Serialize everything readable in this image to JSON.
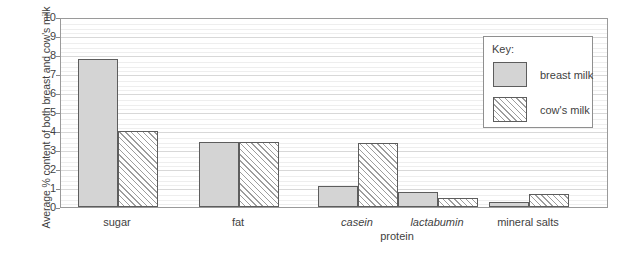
{
  "chart_data": {
    "type": "bar",
    "title": "",
    "xlabel": "",
    "ylabel": "Average % content of both breast and cow's milk",
    "ylim": [
      0,
      10
    ],
    "ytick_labels": [
      "0",
      "1",
      "2",
      "3",
      "4",
      "5",
      "6",
      "7",
      "8",
      "9",
      "10"
    ],
    "grid": true,
    "legend_position": "top-right",
    "legend_title": "Key:",
    "categories": [
      "sugar",
      "fat",
      "casein",
      "lactabumin",
      "mineral salts"
    ],
    "category_styles": [
      "normal",
      "normal",
      "italic",
      "italic",
      "normal"
    ],
    "group_labels": [
      {
        "text": "protein",
        "spans": [
          "casein",
          "lactabumin"
        ]
      }
    ],
    "series": [
      {
        "name": "breast milk",
        "fill": "solid",
        "color": "#d4d4d4",
        "values": [
          7.8,
          3.4,
          1.1,
          0.8,
          0.25
        ]
      },
      {
        "name": "cow's milk",
        "fill": "hatch",
        "color": "#ffffff",
        "values": [
          4.0,
          3.4,
          3.35,
          0.45,
          0.7
        ]
      }
    ]
  },
  "legend": {
    "title": "Key:",
    "entries": [
      {
        "label": "breast  milk",
        "fill": "solid"
      },
      {
        "label": "cow's milk",
        "fill": "hatch"
      }
    ]
  },
  "axis": {
    "y_title": "Average % content of both breast and cow's milk"
  },
  "colors": {
    "bar_fill": "#d4d4d4",
    "bar_border": "#5d5d5d",
    "hatch_line": "#9d9d9d",
    "gridline": "#d8d8d8",
    "plot_border": "#9a9a9a",
    "text": "#3f3f3f"
  }
}
